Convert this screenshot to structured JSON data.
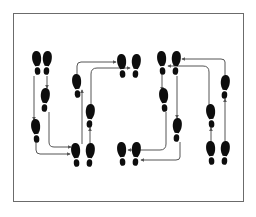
{
  "diagram": {
    "title": "",
    "type": "dance-step footprint diagram",
    "colors": {
      "footprint": "#0d0d0d",
      "arrow": "#555555",
      "frame": "#6b6b6b",
      "background": "#ffffff"
    },
    "footprints": [
      {
        "id": "f1",
        "foot": "left",
        "group": "start-pair-left-column"
      },
      {
        "id": "f2",
        "foot": "right",
        "group": "start-pair-left-column"
      },
      {
        "id": "f3",
        "foot": "right",
        "group": "left-column-step"
      },
      {
        "id": "f4",
        "foot": "left",
        "group": "left-column-step"
      },
      {
        "id": "f5",
        "foot": "left",
        "group": "bottom-pair-left"
      },
      {
        "id": "f6",
        "foot": "right",
        "group": "bottom-pair-left"
      },
      {
        "id": "f7",
        "foot": "left",
        "group": "second-column-step"
      },
      {
        "id": "f8",
        "foot": "right",
        "group": "second-column-step"
      },
      {
        "id": "f9",
        "foot": "left",
        "group": "top-pair-center"
      },
      {
        "id": "f10",
        "foot": "right",
        "group": "top-pair-center"
      },
      {
        "id": "f11",
        "foot": "left",
        "group": "top-pair-right"
      },
      {
        "id": "f12",
        "foot": "right",
        "group": "top-pair-right"
      },
      {
        "id": "f13",
        "foot": "left",
        "group": "third-column-step"
      },
      {
        "id": "f14",
        "foot": "right",
        "group": "third-column-step"
      },
      {
        "id": "f15",
        "foot": "left",
        "group": "bottom-pair-center"
      },
      {
        "id": "f16",
        "foot": "right",
        "group": "bottom-pair-center"
      },
      {
        "id": "f17",
        "foot": "left",
        "group": "right-column-step"
      },
      {
        "id": "f18",
        "foot": "right",
        "group": "right-column-step"
      },
      {
        "id": "f19",
        "foot": "left",
        "group": "bottom-pair-right"
      },
      {
        "id": "f20",
        "foot": "right",
        "group": "bottom-pair-right"
      }
    ],
    "arrows": [
      {
        "from": "f2",
        "to": "f3"
      },
      {
        "from": "f1",
        "to": "f4"
      },
      {
        "from": "f4",
        "to": "f5"
      },
      {
        "from": "f3",
        "to": "f6"
      },
      {
        "from": "f5",
        "to": "f7"
      },
      {
        "from": "f6",
        "to": "f8"
      },
      {
        "from": "f7",
        "to": "f9"
      },
      {
        "from": "f8",
        "to": "f10"
      },
      {
        "from": "f11",
        "to": "f13"
      },
      {
        "from": "f12",
        "to": "f14"
      },
      {
        "from": "f13",
        "to": "f15"
      },
      {
        "from": "f14",
        "to": "f16"
      },
      {
        "from": "f19",
        "to": "f17"
      },
      {
        "from": "f20",
        "to": "f18"
      },
      {
        "from": "f17",
        "to": "f12"
      },
      {
        "from": "f18",
        "to": "f11"
      }
    ]
  }
}
